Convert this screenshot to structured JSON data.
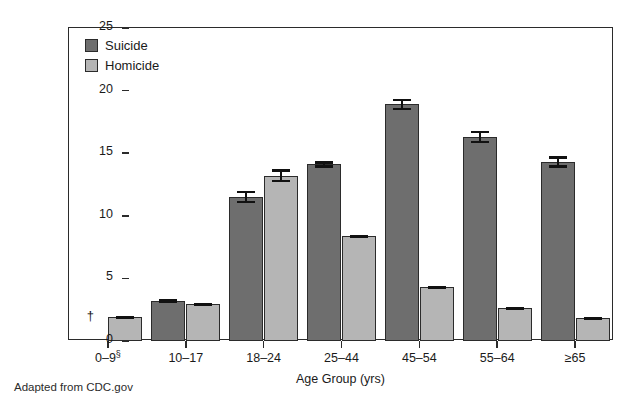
{
  "chart_data": {
    "type": "bar",
    "title": "",
    "xlabel": "Age Group (yrs)",
    "ylabel": "Rate per 100,000 Population",
    "ylim": [
      0,
      25
    ],
    "yticks": [
      0,
      5,
      10,
      15,
      20,
      25
    ],
    "ytick_labels": [
      "0",
      "5",
      "10",
      "15",
      "20",
      "25"
    ],
    "grid": false,
    "legend_position": "top-left",
    "categories": [
      "0–9§",
      "10–17",
      "18–24",
      "25–44",
      "45–54",
      "55–64",
      "≥65"
    ],
    "series": [
      {
        "name": "Suicide",
        "color": "#6e6e6e",
        "values": [
          null,
          3.2,
          11.5,
          14.1,
          18.9,
          16.3,
          14.3
        ],
        "errors": [
          null,
          0.15,
          0.5,
          0.25,
          0.45,
          0.5,
          0.45
        ]
      },
      {
        "name": "Homicide",
        "color": "#b5b5b5",
        "values": [
          1.9,
          2.95,
          13.2,
          8.35,
          4.3,
          2.6,
          1.8
        ],
        "errors": [
          0.12,
          0.12,
          0.5,
          0.15,
          0.12,
          0.12,
          0.12
        ]
      }
    ],
    "annotations": [
      {
        "category": "0–9§",
        "series": "Suicide",
        "symbol": "†",
        "meaning": "data suppressed"
      }
    ]
  },
  "legend": {
    "items": [
      {
        "label": "Suicide",
        "color": "#6e6e6e"
      },
      {
        "label": "Homicide",
        "color": "#b5b5b5"
      }
    ]
  },
  "caption": {
    "text": "Adapted from CDC.gov"
  }
}
